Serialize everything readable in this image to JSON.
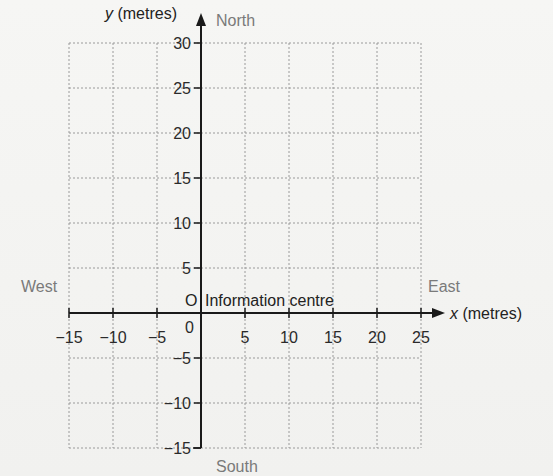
{
  "chart_data": {
    "type": "scatter",
    "title": "",
    "xlabel_var": "x",
    "xlabel_unit": "(metres)",
    "ylabel_var": "y",
    "ylabel_unit": "(metres)",
    "xlim": [
      -15,
      25
    ],
    "ylim": [
      -15,
      30
    ],
    "x_ticks": [
      -15,
      -10,
      -5,
      0,
      5,
      10,
      15,
      20,
      25
    ],
    "x_tick_labels": [
      "-15",
      "-10",
      "-5",
      "0",
      "5",
      "10",
      "15",
      "20",
      "25"
    ],
    "y_ticks": [
      30,
      25,
      20,
      15,
      10,
      5,
      0,
      -5,
      -10,
      -15
    ],
    "y_tick_labels": [
      "30",
      "25",
      "20",
      "15",
      "10",
      "5",
      "0",
      "-5",
      "-10",
      "-15"
    ],
    "grid": true,
    "grid_style": "dotted",
    "directions": {
      "north": "North",
      "south": "South",
      "east": "East",
      "west": "West"
    },
    "annotations": [
      {
        "x": 0,
        "y": 0,
        "marker": "O",
        "text": "Information centre"
      }
    ],
    "series": []
  },
  "labels": {
    "y_axis": "y (metres)",
    "y_axis_var": "y",
    "y_axis_unit": " (metres)",
    "x_axis_var": "x",
    "x_axis_unit": " (metres)",
    "north": "North",
    "south": "South",
    "east": "East",
    "west": "West",
    "origin_marker": "O",
    "origin_text": "Information centre",
    "x_zero": "0"
  },
  "colors": {
    "axis": "#1a1a1a",
    "grid": "#9a9a9a",
    "compass_text": "#7a7a7a",
    "tick_text": "#2a2a2a",
    "background": "#f4f4f2"
  }
}
